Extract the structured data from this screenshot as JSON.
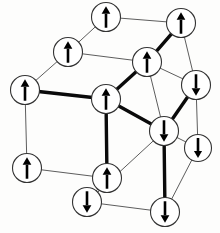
{
  "figure": {
    "canvas": {
      "width": 220,
      "height": 233
    },
    "colors": {
      "background": "#fdfdfc",
      "thin_edge": "#5d5d5d",
      "bold_edge": "#0a0a0a",
      "node_fill": "#ffffff",
      "node_stroke": "#333333",
      "arrow": "#000000"
    },
    "node_radius": 14.5,
    "spins": {
      "up_label": "up",
      "down_label": "down",
      "up_count": 8,
      "down_count": 5
    }
  },
  "chart_data": {
    "type": "diagram",
    "nodes": [
      {
        "id": "n1",
        "label": "top-back-left",
        "x": 106,
        "y": 17,
        "spin": "up",
        "r": 14.5
      },
      {
        "id": "n2",
        "label": "top-back-right",
        "x": 181,
        "y": 23,
        "spin": "up",
        "r": 14.5
      },
      {
        "id": "n3",
        "label": "upper-left-back",
        "x": 68,
        "y": 52,
        "spin": "up",
        "r": 14.5
      },
      {
        "id": "n4",
        "label": "upper-center",
        "x": 147,
        "y": 62,
        "spin": "up",
        "r": 14.5
      },
      {
        "id": "n5",
        "label": "mid-left-front",
        "x": 25,
        "y": 90,
        "spin": "up",
        "r": 14.5
      },
      {
        "id": "n6",
        "label": "mid-center-front",
        "x": 106,
        "y": 99,
        "spin": "up",
        "r": 14.5
      },
      {
        "id": "n7",
        "label": "right-upper",
        "x": 196,
        "y": 85,
        "spin": "down",
        "r": 14.5
      },
      {
        "id": "n8",
        "label": "right-center",
        "x": 164,
        "y": 131,
        "spin": "down",
        "r": 14.5
      },
      {
        "id": "n9",
        "label": "right-lower-back",
        "x": 198,
        "y": 148,
        "spin": "down",
        "r": 13.5
      },
      {
        "id": "n10",
        "label": "bottom-left",
        "x": 27,
        "y": 168,
        "spin": "up",
        "r": 14.5
      },
      {
        "id": "n11",
        "label": "bottom-center",
        "x": 107,
        "y": 178,
        "spin": "up",
        "r": 14.5
      },
      {
        "id": "n12",
        "label": "bottom-front-left",
        "x": 87,
        "y": 202,
        "spin": "down",
        "r": 14.5
      },
      {
        "id": "n13",
        "label": "bottom-right",
        "x": 165,
        "y": 212,
        "spin": "down",
        "r": 14.5
      }
    ],
    "edges_thin": [
      [
        "n1",
        "n2"
      ],
      [
        "n1",
        "n3"
      ],
      [
        "n3",
        "n4"
      ],
      [
        "n2",
        "n4"
      ],
      [
        "n3",
        "n5"
      ],
      [
        "n2",
        "n7"
      ],
      [
        "n4",
        "n8"
      ],
      [
        "n5",
        "n10"
      ],
      [
        "n6",
        "n11"
      ],
      [
        "n10",
        "n11"
      ],
      [
        "n7",
        "n9"
      ],
      [
        "n9",
        "n13"
      ],
      [
        "n12",
        "n13"
      ],
      [
        "n11",
        "n12"
      ],
      [
        "n8",
        "n12"
      ],
      [
        "n6",
        "n8"
      ],
      [
        "n7",
        "n4"
      ],
      [
        "n8",
        "n9"
      ],
      [
        "n5",
        "n6"
      ]
    ],
    "edges_bold": [
      [
        "n2",
        "n4"
      ],
      [
        "n4",
        "n6"
      ],
      [
        "n5",
        "n6"
      ],
      [
        "n6",
        "n11"
      ],
      [
        "n7",
        "n8"
      ],
      [
        "n8",
        "n13"
      ],
      [
        "n6",
        "n8"
      ]
    ],
    "legend": [],
    "xlabel": "",
    "ylabel": ""
  }
}
